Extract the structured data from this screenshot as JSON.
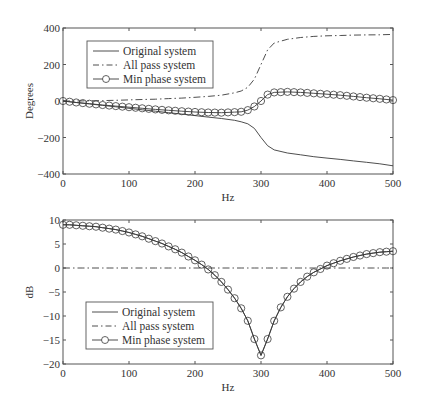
{
  "chart_data": [
    {
      "type": "line",
      "title": "",
      "xlabel": "Hz",
      "ylabel": "Degrees",
      "xlim": [
        0,
        500
      ],
      "ylim": [
        -400,
        400
      ],
      "xticks": [
        0,
        100,
        200,
        300,
        400,
        500
      ],
      "yticks": [
        -400,
        -200,
        0,
        200,
        400
      ],
      "grid": false,
      "legend_position": "upper left",
      "x": [
        0,
        20,
        40,
        60,
        80,
        100,
        120,
        140,
        160,
        180,
        200,
        220,
        240,
        260,
        270,
        280,
        290,
        300,
        310,
        320,
        340,
        360,
        380,
        400,
        420,
        440,
        460,
        480,
        500
      ],
      "series": [
        {
          "name": "Original system",
          "style": "solid",
          "values": [
            0,
            -8,
            -16,
            -24,
            -32,
            -40,
            -48,
            -56,
            -64,
            -72,
            -80,
            -88,
            -96,
            -106,
            -114,
            -125,
            -150,
            -200,
            -245,
            -268,
            -285,
            -295,
            -305,
            -313,
            -320,
            -328,
            -336,
            -344,
            -355
          ]
        },
        {
          "name": "All pass system",
          "style": "dashdot",
          "values": [
            0,
            0,
            1,
            2,
            4,
            6,
            8,
            10,
            13,
            16,
            20,
            25,
            32,
            45,
            55,
            75,
            120,
            200,
            280,
            318,
            338,
            348,
            354,
            357,
            359,
            361,
            362,
            363,
            365
          ]
        },
        {
          "name": "Min phase system",
          "style": "solid-circle-marker",
          "values": [
            0,
            -8,
            -15,
            -22,
            -28,
            -34,
            -40,
            -46,
            -51,
            -56,
            -60,
            -63,
            -64,
            -61,
            -59,
            -50,
            -30,
            0,
            35,
            47,
            50,
            47,
            42,
            37,
            32,
            25,
            18,
            12,
            5
          ]
        }
      ]
    },
    {
      "type": "line",
      "title": "",
      "xlabel": "Hz",
      "ylabel": "dB",
      "xlim": [
        0,
        500
      ],
      "ylim": [
        -20,
        10
      ],
      "xticks": [
        0,
        100,
        200,
        300,
        400,
        500
      ],
      "yticks": [
        -20,
        -15,
        -10,
        -5,
        0,
        5,
        10
      ],
      "grid": false,
      "legend_position": "lower left",
      "x": [
        0,
        10,
        20,
        30,
        40,
        50,
        60,
        70,
        80,
        90,
        100,
        110,
        120,
        130,
        140,
        150,
        160,
        170,
        180,
        190,
        200,
        210,
        220,
        230,
        240,
        250,
        260,
        270,
        280,
        290,
        300,
        310,
        320,
        330,
        340,
        350,
        360,
        370,
        380,
        390,
        400,
        410,
        420,
        430,
        440,
        450,
        460,
        470,
        480,
        490,
        500
      ],
      "series": [
        {
          "name": "Original system",
          "style": "solid",
          "values": [
            9,
            9,
            8.9,
            8.8,
            8.7,
            8.6,
            8.4,
            8.2,
            8,
            7.7,
            7.4,
            7,
            6.6,
            6.1,
            5.6,
            5.1,
            4.5,
            3.9,
            3.2,
            2.4,
            1.6,
            0.7,
            -0.3,
            -1.5,
            -2.9,
            -4.5,
            -6.3,
            -8.4,
            -11,
            -14.8,
            -18.2,
            -14.8,
            -11,
            -8.2,
            -6,
            -4.3,
            -2.9,
            -1.8,
            -0.9,
            -0.2,
            0.5,
            1,
            1.5,
            1.9,
            2.3,
            2.6,
            2.9,
            3.1,
            3.3,
            3.4,
            3.5
          ]
        },
        {
          "name": "All pass system",
          "style": "dashdot",
          "values": [
            0,
            0,
            0,
            0,
            0,
            0,
            0,
            0,
            0,
            0,
            0,
            0,
            0,
            0,
            0,
            0,
            0,
            0,
            0,
            0,
            0,
            0,
            0,
            0,
            0,
            0,
            0,
            0,
            0,
            0,
            0,
            0,
            0,
            0,
            0,
            0,
            0,
            0,
            0,
            0,
            0,
            0,
            0,
            0,
            0,
            0,
            0,
            0,
            0,
            0,
            0
          ]
        },
        {
          "name": "Min phase system",
          "style": "solid-circle-marker",
          "values": [
            9,
            9,
            8.9,
            8.8,
            8.7,
            8.6,
            8.4,
            8.2,
            8,
            7.7,
            7.4,
            7,
            6.6,
            6.1,
            5.6,
            5.1,
            4.5,
            3.9,
            3.2,
            2.4,
            1.6,
            0.7,
            -0.3,
            -1.5,
            -2.9,
            -4.5,
            -6.3,
            -8.4,
            -11,
            -14.8,
            -18.2,
            -14.8,
            -11,
            -8.2,
            -6,
            -4.3,
            -2.9,
            -1.8,
            -0.9,
            -0.2,
            0.5,
            1,
            1.5,
            1.9,
            2.3,
            2.6,
            2.9,
            3.1,
            3.3,
            3.4,
            3.5
          ]
        }
      ]
    }
  ],
  "top_plot": {
    "ylabel": "Degrees",
    "xlabel": "Hz",
    "legend": [
      "Original system",
      "All pass system",
      "Min phase system"
    ]
  },
  "bottom_plot": {
    "ylabel": "dB",
    "xlabel": "Hz",
    "legend": [
      "Original system",
      "All pass system",
      "Min phase system"
    ]
  },
  "colors": {
    "line": "#3a3a3a",
    "axis": "#555555",
    "background": "#ffffff"
  }
}
